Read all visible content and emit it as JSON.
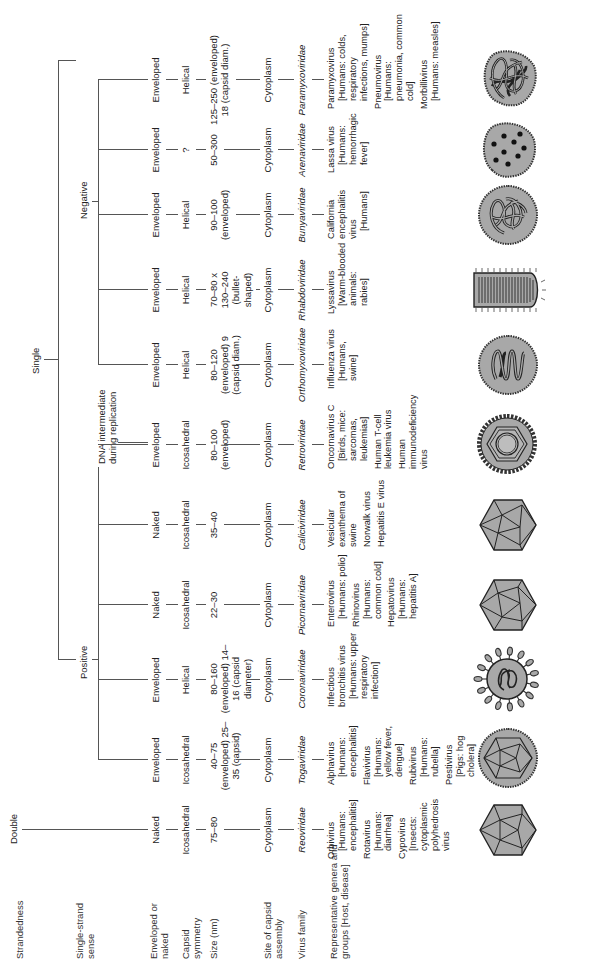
{
  "row_labels": {
    "strandedness": "Strandedness",
    "single_strand_sense": "Single-strand sense",
    "enveloped_or_naked": "Enveloped or naked",
    "capsid_symmetry": "Capsid symmetry",
    "size": "Size (nm)",
    "site_of_assembly": "Site of capsid assembly",
    "virus_family": "Virus family",
    "representatives": "Representative genera and groups [Host, disease]"
  },
  "tree": {
    "double": "Double",
    "single": "Single",
    "positive": "Positive",
    "negative": "Negative",
    "dna_intermediate": "DNA intermediate during replication"
  },
  "families": [
    {
      "envelope": "Naked",
      "symmetry": "Icosahedral",
      "size": "75–80",
      "site": "Cytoplasm",
      "family": "Reoviridae",
      "reps": [
        {
          "genus": "Orbivirus",
          "host": "[Humans: encephalitis]"
        },
        {
          "genus": "Rotavirus",
          "host": "[Humans: diarrhea]"
        },
        {
          "genus": "Cypovirus",
          "host": "[Insects: cytoplasmic polyhedrosis virus"
        }
      ],
      "shape": "icosahedron"
    },
    {
      "envelope": "Enveloped",
      "symmetry": "Icosahedral",
      "size": "40–75 (enveloped) 25–35 (capsid)",
      "site": "Cytoplasm",
      "family": "Togaviridae",
      "reps": [
        {
          "genus": "Alphavirus",
          "host": "[Humans: encephalitis]"
        },
        {
          "genus": "Flavivirus",
          "host": "[Humans: yellow fever, dengue]"
        },
        {
          "genus": "Rubivirus",
          "host": "[Humans: rubella]"
        },
        {
          "genus": "Pestivirus",
          "host": "[Pigs: hog cholera]"
        }
      ],
      "shape": "enveloped-icosahedron"
    },
    {
      "envelope": "Enveloped",
      "symmetry": "Helical",
      "size": "80–160 (enveloped) 14–16 (capsid diameter)",
      "site": "Cytoplasm",
      "family": "Coronaviridae",
      "reps": [
        {
          "genus": "Infectious bronchitis virus",
          "host": "[Humans: upper respiratory infection]"
        }
      ],
      "shape": "corona"
    },
    {
      "envelope": "Naked",
      "symmetry": "Icosahedral",
      "size": "22–30",
      "site": "Cytoplasm",
      "family": "Picornaviridae",
      "reps": [
        {
          "genus": "Enterovirus",
          "host": "[Humans: polio]"
        },
        {
          "genus": "Rhinovirus",
          "host": "[Humans: common cold]"
        },
        {
          "genus": "Hepatovirus",
          "host": "[Humans: hepatitis A]"
        }
      ],
      "shape": "icosahedron"
    },
    {
      "envelope": "Naked",
      "symmetry": "Icosahedral",
      "size": "35–40",
      "site": "Cytoplasm",
      "family": "Caliciviridae",
      "reps": [
        {
          "genus": "Vesicular exanthema of swine",
          "host": ""
        },
        {
          "genus": "Norwalk virus",
          "host": ""
        },
        {
          "genus": "Hepatitis E virus",
          "host": ""
        }
      ],
      "shape": "icosahedron"
    },
    {
      "envelope": "Enveloped",
      "symmetry": "Icosahedral",
      "size": "80–100 (enveloped)",
      "site": "Cytoplasm",
      "family": "Retroviridae",
      "reps": [
        {
          "genus": "Oncornavirus C",
          "host": "[Birds, mice: sarcomas, leukemias]"
        },
        {
          "genus": "Human T-cell leukemia virus",
          "host": ""
        },
        {
          "genus": "Human immunodeficiency virus",
          "host": ""
        }
      ],
      "shape": "retro"
    },
    {
      "envelope": "Enveloped",
      "symmetry": "Helical",
      "size": "80–120 (enveloped) 9 (capsid diam.)",
      "site": "Cytoplasm",
      "family": "Orthomyxoviridae",
      "reps": [
        {
          "genus": "Influenza virus",
          "host": "[Humans, swine]"
        }
      ],
      "shape": "coil"
    },
    {
      "envelope": "Enveloped",
      "symmetry": "Helical",
      "size": "70–80 x 130–240 (bullet-shaped)",
      "site": "Cytoplasm",
      "family": "Rhabdoviridae",
      "reps": [
        {
          "genus": "Lyssavirus",
          "host": "[Warm-blooded animals: rabies]"
        }
      ],
      "shape": "bullet"
    },
    {
      "envelope": "Enveloped",
      "symmetry": "Helical",
      "size": "90–100 (enveloped)",
      "site": "Cytoplasm",
      "family": "Bunyaviridae",
      "reps": [
        {
          "genus": "California encephalitis virus",
          "host": "[Humans]"
        }
      ],
      "shape": "tangle"
    },
    {
      "envelope": "Enveloped",
      "symmetry": "?",
      "size": "50–300",
      "site": "Cytoplasm",
      "family": "Arenaviridae",
      "reps": [
        {
          "genus": "Lassa virus",
          "host": "[Humans: hemorrhagic fever]"
        }
      ],
      "shape": "dots"
    },
    {
      "envelope": "Enveloped",
      "symmetry": "Helical",
      "size": "125–250 (enveloped) 18 (capsid diam.)",
      "site": "Cytoplasm",
      "family": "Paramyxoviridae",
      "reps": [
        {
          "genus": "Paramyxovirus",
          "host": "[Humans: colds, respiratory infections, mumps]"
        },
        {
          "genus": "Pneumovirus",
          "host": "[Humans: pneumonia, common cold]"
        },
        {
          "genus": "Morbillivirus",
          "host": "[Humans: measles]"
        }
      ],
      "shape": "tangle-dense"
    }
  ]
}
